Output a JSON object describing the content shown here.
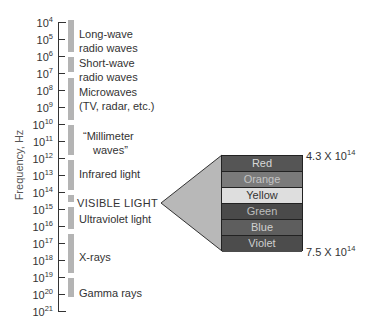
{
  "diagram": {
    "y_axis_label": "Frequency, Hz",
    "ticks": [
      {
        "base": "10",
        "exp": "4"
      },
      {
        "base": "10",
        "exp": "5"
      },
      {
        "base": "10",
        "exp": "6"
      },
      {
        "base": "10",
        "exp": "7"
      },
      {
        "base": "10",
        "exp": "8"
      },
      {
        "base": "10",
        "exp": "9"
      },
      {
        "base": "10",
        "exp": "10"
      },
      {
        "base": "10",
        "exp": "11"
      },
      {
        "base": "10",
        "exp": "12"
      },
      {
        "base": "10",
        "exp": "13"
      },
      {
        "base": "10",
        "exp": "14"
      },
      {
        "base": "10",
        "exp": "15"
      },
      {
        "base": "10",
        "exp": "16"
      },
      {
        "base": "10",
        "exp": "17"
      },
      {
        "base": "10",
        "exp": "18"
      },
      {
        "base": "10",
        "exp": "19"
      },
      {
        "base": "10",
        "exp": "20"
      },
      {
        "base": "10",
        "exp": "21"
      }
    ],
    "bands": [
      {
        "line1": "Long-wave",
        "line2": "radio waves"
      },
      {
        "line1": "Short-wave",
        "line2": "radio waves"
      },
      {
        "line1": "Microwaves",
        "line2": "(TV, radar, etc.)"
      },
      {
        "line1": "“Millimeter",
        "line2": "waves”"
      },
      {
        "line1": "Infrared light"
      },
      {
        "line1": "VISIBLE LIGHT"
      },
      {
        "line1": "Ultraviolet light"
      },
      {
        "line1": "X-rays"
      },
      {
        "line1": "Gamma rays"
      }
    ],
    "visible_spectrum": {
      "colors": [
        {
          "label": "Red",
          "fill": "#555555",
          "text": "#d8d8d8"
        },
        {
          "label": "Orange",
          "fill": "#7a7a7a",
          "text": "#c4c4c4"
        },
        {
          "label": "Yellow",
          "fill": "#dedede",
          "text": "#333333"
        },
        {
          "label": "Green",
          "fill": "#4a4a4a",
          "text": "#bdbdbd"
        },
        {
          "label": "Blue",
          "fill": "#5e5e5e",
          "text": "#d0d0d0"
        },
        {
          "label": "Violet",
          "fill": "#4c4c4c",
          "text": "#cfcfcf"
        }
      ],
      "top_freq": {
        "mantissa": "4.3 X 10",
        "exp": "14"
      },
      "bottom_freq": {
        "mantissa": "7.5 X 10",
        "exp": "14"
      },
      "wedge_color": "#b8b8b8"
    }
  }
}
